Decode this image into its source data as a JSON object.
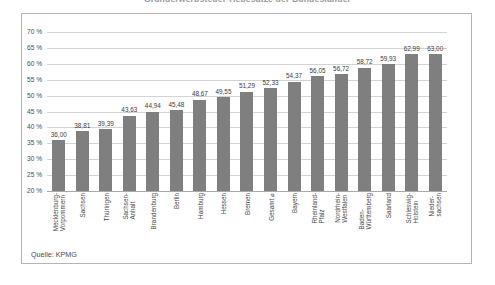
{
  "headline": {
    "text": "Grunderwerbsteuer-Hebesätze der Bundesländer"
  },
  "source": {
    "text": "Quelle: KPMG"
  },
  "chart_data": {
    "type": "bar",
    "title": "Grunderwerbsteuer-Hebesätze der Bundesländer",
    "xlabel": "",
    "ylabel": "",
    "ylim": [
      20,
      70
    ],
    "ytick_step": 5,
    "ytick_labels": [
      "70 %",
      "65 %",
      "60 %",
      "55 %",
      "50 %",
      "45 %",
      "40 %",
      "35 %",
      "30 %",
      "25 %",
      "20 %"
    ],
    "ytick_values": [
      70,
      65,
      60,
      55,
      50,
      45,
      40,
      35,
      30,
      25,
      20
    ],
    "grid": true,
    "legend": null,
    "bar_color": "#7f7f7f",
    "value_format": "comma-decimal",
    "categories": [
      "Mecklenburg-\nVorpommern",
      "Sachsen",
      "Thüringen",
      "Sachsen-\nAnhalt",
      "Brandenburg",
      "Berlin",
      "Hamburg",
      "Hessen",
      "Bremen",
      "Gesamt ⌀",
      "Bayern",
      "Rheinland-\nPfalz",
      "Nordrhein-\nWestfalen",
      "Baden-\nWürttemberg",
      "Saarland",
      "Schleswig-\nHolstein",
      "Nieder-\nsachsen"
    ],
    "values": [
      36.0,
      38.81,
      39.39,
      43.63,
      44.94,
      45.48,
      48.67,
      49.55,
      51.29,
      52.33,
      54.37,
      56.05,
      56.72,
      58.72,
      59.93,
      62.99,
      63.0
    ],
    "value_labels": [
      "36,00",
      "38,81",
      "39,39",
      "43,63",
      "44,94",
      "45,48",
      "48,67",
      "49,55",
      "51,29",
      "52,33",
      "54,37",
      "56,05",
      "56,72",
      "58,72",
      "59,93",
      "62,99",
      "63,00"
    ]
  }
}
